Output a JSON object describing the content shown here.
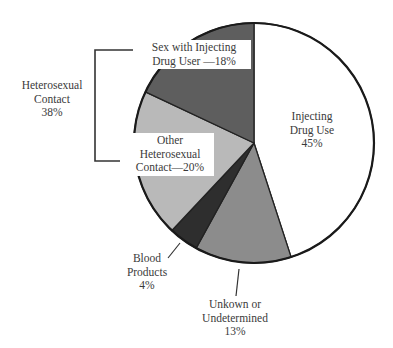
{
  "chart_data": {
    "type": "pie",
    "title": "",
    "start_angle_deg": 0,
    "direction": "clockwise",
    "slices": [
      {
        "label": "Injecting Drug Use",
        "value": 45,
        "color": "#ffffff"
      },
      {
        "label": "Unkown or Undetermined",
        "value": 13,
        "color": "#8c8c8c"
      },
      {
        "label": "Blood Products",
        "value": 4,
        "color": "#2e2e2e"
      },
      {
        "label": "Other Heterosexual Contact",
        "value": 20,
        "color": "#b9b9b9"
      },
      {
        "label": "Sex with Injecting Drug User",
        "value": 18,
        "color": "#5e5e5e"
      }
    ],
    "group_annotations": [
      {
        "label": "Heterosexual Contact",
        "value": 38,
        "members": [
          "Sex with Injecting Drug User",
          "Other Heterosexual Contact"
        ]
      }
    ]
  },
  "labels": {
    "injecting": {
      "l1": "Injecting",
      "l2": "Drug Use",
      "l3": "45%"
    },
    "sex_idu": {
      "l1": "Sex with Injecting",
      "l2": "Drug User —18%"
    },
    "other_hetero": {
      "l1": "Other",
      "l2": "Heterosexual",
      "l3": "Contact—20%"
    },
    "hetero_group": {
      "l1": "Heterosexual",
      "l2": "Contact",
      "l3": "38%"
    },
    "blood": {
      "l1": "Blood",
      "l2": "Products",
      "l3": "4%"
    },
    "unknown": {
      "l1": "Unkown or",
      "l2": "Undetermined",
      "l3": "13%"
    }
  }
}
